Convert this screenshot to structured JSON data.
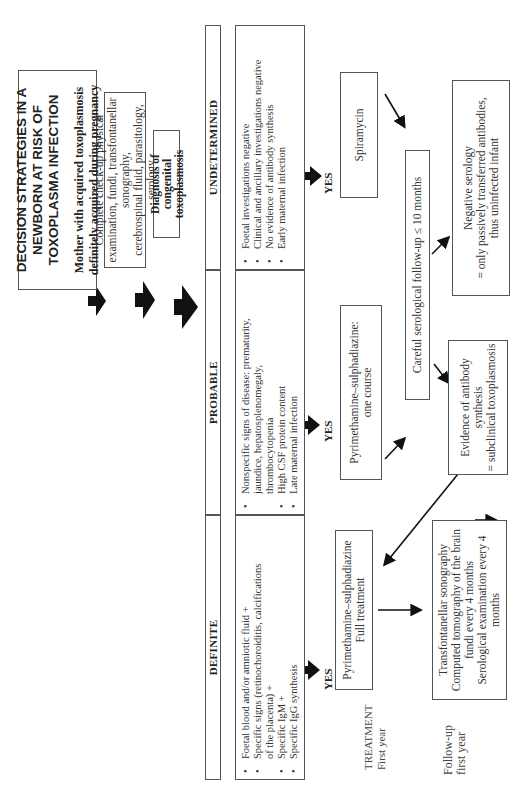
{
  "title": {
    "line1": "DECISION STRATEGIES IN A NEWBORN AT RISK OF",
    "line2": "TOXOPLASMA INFECTION",
    "subtitle": "Mother with acquired toxoplasmosis definitely acquired during pregnancy"
  },
  "checkup": {
    "line1": "Complete check-up physical examination, fundi, transfontanellar sonography,",
    "line2": "cerebrospinal fluid, parasitology, serology"
  },
  "diagnosis": {
    "label": "Diagnosis of congenital toxoplasmosis"
  },
  "categories": [
    {
      "header": "DEFINITE",
      "criteria": [
        "Foetal blood and/or amniotic fluid +",
        "Specific signs (retinochoroiditis, calcifications",
        "of the placenta) +",
        "Specific IgM +",
        "Specific IgG synthesis"
      ]
    },
    {
      "header": "PROBABLE",
      "criteria": [
        "Nonspecific signs of disease: prematurity,",
        "jaundice, hepatosplenomegaly,",
        "thrombocytopenia",
        "High CSF protein content",
        "Late maternal infection"
      ]
    },
    {
      "header": "UNDETERMINED",
      "criteria": [
        "Foetal investigations negative",
        "Clinical and ancillary investigations negative",
        "No evidence of antibody synthesis",
        "Early maternal infection"
      ]
    }
  ],
  "yes_label": "YES",
  "treatments": {
    "definite": {
      "line1": "Pyrimethamine–sulphadiazine",
      "line2": "Full treatment"
    },
    "probable": {
      "line1": "Pyrimethamine–sulphadiazine:",
      "line2": "one course"
    },
    "undetermined": {
      "line1": "Spiramycin"
    }
  },
  "followup_serology": {
    "label": "Careful serological follow-up ≤ 10 months"
  },
  "negative_serology": {
    "line1": "Negative serology",
    "line2": "= only passively transferred antibodies,",
    "line3": "thus uninfected infant"
  },
  "evidence": {
    "line1": "Evidence of antibody synthesis",
    "line2": "= subclinical toxoplasmosis"
  },
  "followup_box": {
    "items": [
      "Transfontanellar sonography",
      "Computed tomography of the brain",
      "fundi every 4 months",
      "Serological examination every 4 months"
    ]
  },
  "side_labels": {
    "treatment": {
      "line1": "TREATMENT",
      "line2": "First year"
    },
    "followup": {
      "line1": "Follow-up",
      "line2": "first year"
    }
  }
}
